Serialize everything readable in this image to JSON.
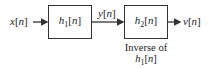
{
  "diagram": {
    "input_signal": {
      "base": "x",
      "arg": "[n]"
    },
    "block1": {
      "base": "h",
      "sub": "1",
      "arg": "[n]"
    },
    "intermediate_signal": {
      "base": "y",
      "arg": "[n]"
    },
    "block2": {
      "base": "h",
      "sub": "2",
      "arg": "[n]"
    },
    "output_signal": {
      "base": "v",
      "arg": "[n]"
    },
    "block2_caption": {
      "line1": "Inverse of",
      "line2": {
        "base": "h",
        "sub": "1",
        "arg": "[n]"
      }
    }
  },
  "colors": {
    "line": "#333333",
    "text": "#222222",
    "background": "#ffffff"
  }
}
